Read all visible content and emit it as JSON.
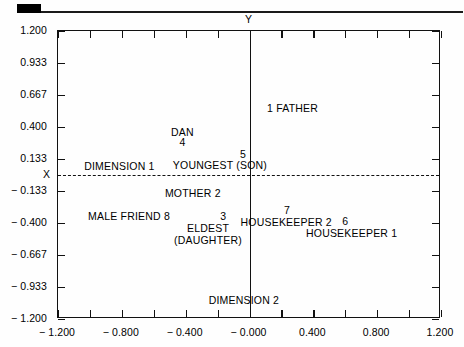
{
  "chart_data": {
    "type": "scatter",
    "title": "",
    "xlabel": "DIMENSION 1",
    "ylabel": "DIMENSION 2",
    "axis_name_x": "X",
    "axis_name_y": "Y",
    "xlim": [
      -1.2,
      1.2
    ],
    "ylim": [
      -1.2,
      1.2
    ],
    "grid": false,
    "legend": "none",
    "xticks": [
      "-1.200",
      "-0.800",
      "-0.400",
      "-0.000",
      "0.400",
      "0.800",
      "1.200"
    ],
    "xtick_values": [
      -1.2,
      -0.8,
      -0.4,
      0.0,
      0.4,
      0.8,
      1.2
    ],
    "yticks": [
      "1.200",
      "0.933",
      "0.667",
      "0.400",
      "0.133",
      "-0.133",
      "-0.400",
      "-0.667",
      "-0.933",
      "-1.200"
    ],
    "ytick_values": [
      1.2,
      0.933,
      0.667,
      0.4,
      0.133,
      -0.133,
      -0.4,
      -0.667,
      -0.933,
      -1.2
    ],
    "minor_tick_step": 0.2,
    "origin_lines": {
      "vertical_at_x": 0.0,
      "horizontal_at_y": 0.0,
      "horizontal_style": "dashed"
    },
    "points": [
      {
        "id": "1",
        "label": "FATHER",
        "x": 0.27,
        "y": 0.56,
        "num_side": "left"
      },
      {
        "id": "4",
        "label": "DAN",
        "x": -0.42,
        "y": 0.335,
        "num_side": "below"
      },
      {
        "id": "5",
        "label": "YOUNGEST (SON)",
        "x": -0.15,
        "y": 0.105,
        "num_side": "above-right"
      },
      {
        "id": "2",
        "label": "MOTHER",
        "x": -0.39,
        "y": -0.14,
        "num_side": "right"
      },
      {
        "id": "8",
        "label": "MALE FRIEND",
        "x": -0.8,
        "y": -0.34,
        "num_side": "right"
      },
      {
        "id": "3",
        "label": "ELDEST\n(DAUGHTER)",
        "x": -0.22,
        "y": -0.4,
        "num_side": "above"
      },
      {
        "id": "7",
        "label": "HOUSEKEEPER 2",
        "x": 0.255,
        "y": -0.33,
        "num_side": "above"
      },
      {
        "id": "6",
        "label": "HOUSEKEEPER 1",
        "x": 0.62,
        "y": -0.425,
        "num_side": "above"
      }
    ],
    "annotations": [
      {
        "text": "1  FATHER",
        "x": 0.27,
        "y": 0.56
      },
      {
        "text": "DAN",
        "x": -0.42,
        "y": 0.36
      },
      {
        "text": "4",
        "x": -0.42,
        "y": 0.275
      },
      {
        "text": "5",
        "x": -0.04,
        "y": 0.175
      },
      {
        "text": "YOUNGEST (SON)",
        "x": -0.185,
        "y": 0.085
      },
      {
        "text": "DIMENSION  1",
        "x": -0.815,
        "y": 0.075
      },
      {
        "text": "MOTHER  2",
        "x": -0.355,
        "y": -0.15
      },
      {
        "text": "MALE FRIEND  8",
        "x": -0.755,
        "y": -0.345
      },
      {
        "text": "3",
        "x": -0.165,
        "y": -0.34
      },
      {
        "text": "ELDEST",
        "x": -0.26,
        "y": -0.44
      },
      {
        "text": "(DAUGHTER)",
        "x": -0.26,
        "y": -0.545
      },
      {
        "text": "7",
        "x": 0.235,
        "y": -0.29
      },
      {
        "text": "HOUSEKEEPER  2",
        "x": 0.23,
        "y": -0.39
      },
      {
        "text": "6",
        "x": 0.6,
        "y": -0.38
      },
      {
        "text": "HOUSEKEEPER  1",
        "x": 0.64,
        "y": -0.48
      },
      {
        "text": "DIMENSION  2",
        "x": -0.035,
        "y": -1.045
      }
    ]
  },
  "figure": {
    "axis_x_name": "X",
    "axis_y_name": "Y",
    "label_dimension_1": "DIMENSION  1",
    "label_dimension_2": "DIMENSION  2",
    "label_father": "1  FATHER",
    "label_dan": "DAN",
    "label_dan_num": "4",
    "label_youngest_num": "5",
    "label_youngest": "YOUNGEST (SON)",
    "label_mother": "MOTHER  2",
    "label_male_friend": "MALE FRIEND  8",
    "label_eldest_num": "3",
    "label_eldest_line1": "ELDEST",
    "label_eldest_line2": "(DAUGHTER)",
    "label_hk2_num": "7",
    "label_hk2": "HOUSEKEEPER  2",
    "label_hk1_num": "6",
    "label_hk1": "HOUSEKEEPER  1"
  }
}
